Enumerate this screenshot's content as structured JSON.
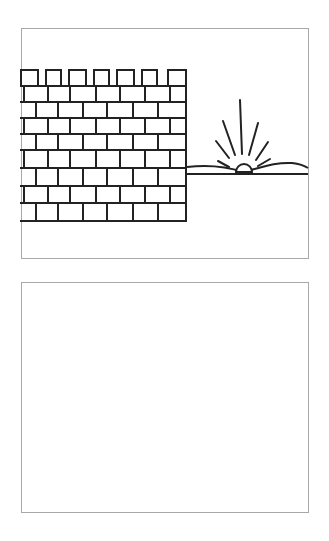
{
  "illustration": {
    "description": "Line drawing of a crenellated brick wall on the left and a sun rising over a horizon on the right",
    "stroke_color": "#222222",
    "frame_color": "#a8a8a8",
    "wall": {
      "left": 21,
      "right": 186,
      "top": 70,
      "battlement_bottom": 86,
      "bottom": 221,
      "merlons": [
        [
          21,
          38
        ],
        [
          46,
          61
        ],
        [
          69,
          86
        ],
        [
          94,
          109
        ],
        [
          117,
          134
        ],
        [
          142,
          157
        ],
        [
          168,
          186
        ]
      ],
      "course_lines_y": [
        86,
        102,
        118,
        134,
        150,
        168,
        186,
        203,
        221
      ],
      "joints_odd_rows": [
        24,
        48,
        70,
        96,
        120,
        145,
        170
      ],
      "joints_even_rows": [
        36,
        58,
        83,
        107,
        133,
        158
      ]
    },
    "horizon": {
      "straight_line_y": 174,
      "hill_path": "M187,167 C205,165 225,166 243,172 C260,168 275,162 292,163 C300,164 305,166 308,168"
    },
    "sun": {
      "cx": 244,
      "cy": 172,
      "r": 8,
      "rays": [
        [
          240,
          100,
          242,
          154
        ],
        [
          223,
          121,
          235,
          155
        ],
        [
          258,
          123,
          249,
          155
        ],
        [
          216,
          141,
          229,
          158
        ],
        [
          268,
          142,
          256,
          160
        ],
        [
          218,
          161,
          229,
          167
        ],
        [
          270,
          159,
          258,
          166
        ]
      ]
    }
  },
  "panels": {
    "top_label": "Illustration panel",
    "bottom_label": "Empty panel"
  }
}
